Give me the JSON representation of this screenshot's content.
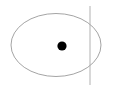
{
  "figure": {
    "name": "ellipse-with-point-and-vertical-line",
    "width": 116,
    "height": 92,
    "background_color": "#ffffff",
    "elements": {
      "ellipse": {
        "icon_name": "ellipse-outline-shape",
        "center_x": 56,
        "center_y": 45,
        "radius_x": 45,
        "radius_y": 31.5,
        "stroke_color": "#9a9a9a",
        "stroke_width": 0.9,
        "fill": "none"
      },
      "point": {
        "icon_name": "filled-dot-marker",
        "center_x": 62,
        "center_y": 46,
        "radius": 4.6,
        "fill_color": "#000000"
      },
      "vertical_line": {
        "icon_name": "vertical-line",
        "x": 90,
        "y_start": 6,
        "y_end": 85,
        "stroke_color": "#a8a8a8",
        "stroke_width": 0.9
      }
    }
  }
}
